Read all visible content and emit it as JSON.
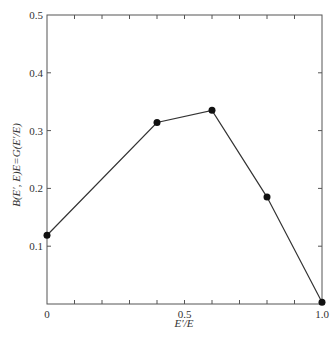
{
  "chart_data": {
    "type": "line",
    "title": "",
    "xlabel": "E′/E",
    "ylabel": "B(E′, E)E=G(E′/E)",
    "xlim": [
      0,
      1.0
    ],
    "ylim": [
      0,
      0.5
    ],
    "grid": false,
    "legend": null,
    "x_ticks": [
      0,
      0.5,
      1.0
    ],
    "x_tick_labels": [
      "0",
      "0.5",
      "1.0"
    ],
    "x_minor_ticks": [
      0.1,
      0.2,
      0.3,
      0.4,
      0.6,
      0.7,
      0.8,
      0.9
    ],
    "y_ticks": [
      0.1,
      0.2,
      0.3,
      0.4,
      0.5
    ],
    "y_tick_labels": [
      "0.1",
      "0.2",
      "0.3",
      "0.4",
      "0.5"
    ],
    "series": [
      {
        "name": "G(E′/E)",
        "marker": "filled-circle",
        "color": "#111111",
        "x": [
          0,
          0.4,
          0.6,
          0.8,
          1.0
        ],
        "values": [
          0.119,
          0.314,
          0.335,
          0.185,
          0.003
        ]
      }
    ]
  }
}
